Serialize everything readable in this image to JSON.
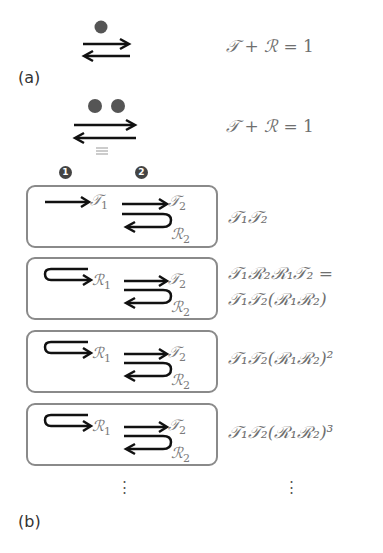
{
  "panel_a": {
    "label": "(a)",
    "single_barrier": {
      "dots": 1,
      "equation": {
        "T": "𝒯",
        "plus": "+",
        "R": "ℛ",
        "eq": "= 1"
      }
    },
    "double_barrier": {
      "dots": 2,
      "equiv": "≡",
      "equation": {
        "T": "𝒯",
        "plus": "+",
        "R": "ℛ",
        "eq": "= 1"
      }
    }
  },
  "panel_b": {
    "label": "(b)",
    "markers": [
      "1",
      "2"
    ],
    "rows": [
      {
        "first_symbol": "𝒯",
        "first_sub": "1",
        "t2": "𝒯",
        "t2_sub": "2",
        "r2": "ℛ",
        "r2_sub": "2",
        "expr_line1": "𝒯₁𝒯₂",
        "expr_line2": ""
      },
      {
        "first_symbol": "ℛ",
        "first_sub": "1",
        "t2": "𝒯",
        "t2_sub": "2",
        "r2": "ℛ",
        "r2_sub": "2",
        "expr_line1": "𝒯₁ℛ₂ℛ₁𝒯₂ =",
        "expr_line2": "𝒯₁𝒯₂(ℛ₁ℛ₂)"
      },
      {
        "first_symbol": "ℛ",
        "first_sub": "1",
        "t2": "𝒯",
        "t2_sub": "2",
        "r2": "ℛ",
        "r2_sub": "2",
        "expr_line1": "𝒯₁𝒯₂(ℛ₁ℛ₂)²",
        "expr_line2": ""
      },
      {
        "first_symbol": "ℛ",
        "first_sub": "1",
        "t2": "𝒯",
        "t2_sub": "2",
        "r2": "ℛ",
        "r2_sub": "2",
        "expr_line1": "𝒯₁𝒯₂(ℛ₁ℛ₂)³",
        "expr_line2": ""
      }
    ],
    "continuation": "⋮"
  }
}
